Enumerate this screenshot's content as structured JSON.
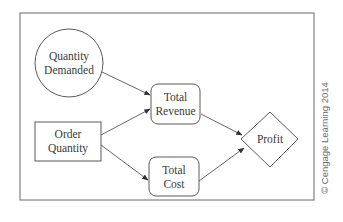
{
  "diagram": {
    "type": "influence-diagram",
    "nodes": [
      {
        "id": "quantity_demanded",
        "shape": "circle",
        "lines": [
          "Quantity",
          "Demanded"
        ]
      },
      {
        "id": "order_quantity",
        "shape": "rectangle",
        "lines": [
          "Order",
          "Quantity"
        ]
      },
      {
        "id": "total_revenue",
        "shape": "rounded-rectangle",
        "lines": [
          "Total",
          "Revenue"
        ]
      },
      {
        "id": "total_cost",
        "shape": "rounded-rectangle",
        "lines": [
          "Total",
          "Cost"
        ]
      },
      {
        "id": "profit",
        "shape": "diamond",
        "lines": [
          "Profit"
        ]
      }
    ],
    "edges": [
      {
        "from": "quantity_demanded",
        "to": "total_revenue"
      },
      {
        "from": "order_quantity",
        "to": "total_revenue"
      },
      {
        "from": "order_quantity",
        "to": "total_cost"
      },
      {
        "from": "total_revenue",
        "to": "profit"
      },
      {
        "from": "total_cost",
        "to": "profit"
      }
    ]
  },
  "credit": "© Cengage Learning 2014",
  "colors": {
    "stroke": "#5a5a5a",
    "text": "#3a3a3a",
    "background": "#ffffff"
  }
}
